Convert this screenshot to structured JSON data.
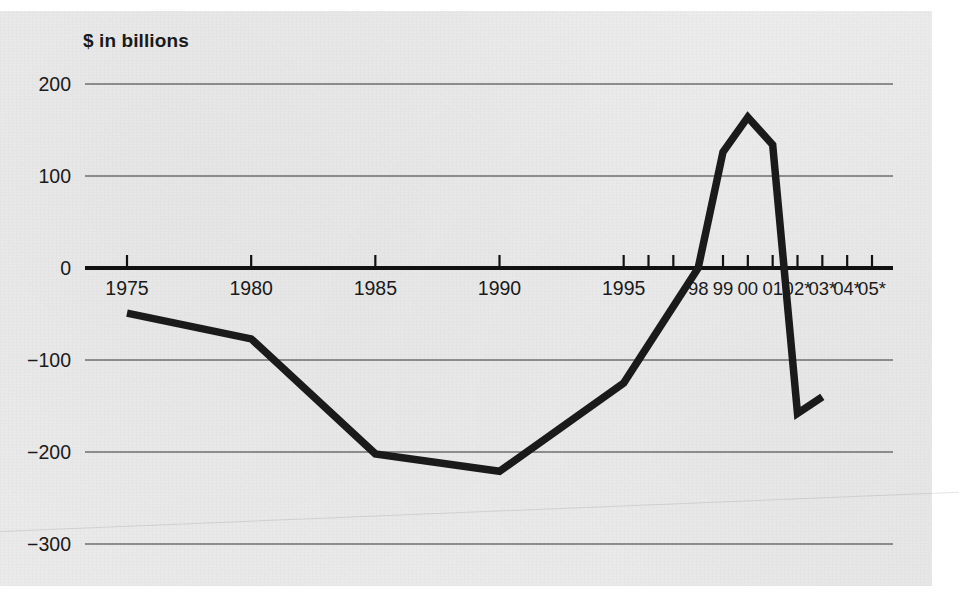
{
  "chart": {
    "title": "$ in billions",
    "axis_note_symbol": "*",
    "colors": {
      "series_line": "#1a1a1a",
      "gridline": "#6e6e6e",
      "zero_axis": "#111111",
      "background_paper": "#ececed",
      "text": "#1a1a1a"
    }
  },
  "chart_data": {
    "type": "line",
    "title": "$ in billions",
    "subtitle": "",
    "xlabel": "",
    "ylabel": "$ in billions",
    "ylim": [
      -340,
      230
    ],
    "xlim": [
      1974,
      2006
    ],
    "grid": true,
    "legend": null,
    "y_ticks": [
      200,
      100,
      0,
      -100,
      -200,
      -300
    ],
    "y_tick_labels": [
      "200",
      "100",
      "0",
      "−100",
      "−200",
      "−300"
    ],
    "x_ticks": [
      1975,
      1980,
      1985,
      1990,
      1995,
      1996,
      1997,
      1998,
      1999,
      2000,
      2001,
      2002,
      2003,
      2004,
      2005
    ],
    "x_tick_labels": [
      {
        "year": 1975,
        "label": "1975",
        "shown": true,
        "projected": false
      },
      {
        "year": 1980,
        "label": "1980",
        "shown": true,
        "projected": false
      },
      {
        "year": 1985,
        "label": "1985",
        "shown": true,
        "projected": false
      },
      {
        "year": 1990,
        "label": "1990",
        "shown": true,
        "projected": false
      },
      {
        "year": 1995,
        "label": "1995",
        "shown": true,
        "projected": false
      },
      {
        "year": 1996,
        "label": "",
        "shown": false,
        "projected": false
      },
      {
        "year": 1997,
        "label": "",
        "shown": false,
        "projected": false
      },
      {
        "year": 1998,
        "label": "98",
        "shown": true,
        "projected": false
      },
      {
        "year": 1999,
        "label": "99",
        "shown": true,
        "projected": false
      },
      {
        "year": 2000,
        "label": "00",
        "shown": true,
        "projected": false
      },
      {
        "year": 2001,
        "label": "01",
        "shown": true,
        "projected": false
      },
      {
        "year": 2002,
        "label": "02*",
        "shown": true,
        "projected": true
      },
      {
        "year": 2003,
        "label": "03*",
        "shown": true,
        "projected": true
      },
      {
        "year": 2004,
        "label": "04*",
        "shown": true,
        "projected": true
      },
      {
        "year": 2005,
        "label": "05*",
        "shown": true,
        "projected": true
      }
    ],
    "series": [
      {
        "name": "Federal budget surplus/deficit",
        "color": "#1a1a1a",
        "x": [
          1975,
          1980,
          1985,
          1990,
          1995,
          1998,
          1999,
          2000,
          2001,
          2002,
          2003
        ],
        "values": [
          -49,
          -77,
          -202,
          -221,
          -125,
          0,
          126,
          164,
          134,
          -158,
          -140
        ]
      }
    ],
    "annotations": []
  }
}
